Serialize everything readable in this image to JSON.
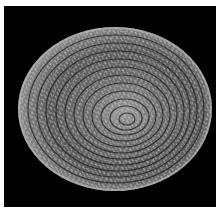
{
  "image": {
    "description": "Woven coiled basket viewed from above on a black background",
    "background_color": "#000000",
    "border_color": "#ffffff",
    "subject": "coiled woven basket",
    "colors": {
      "rim_light": "#d8d8d8",
      "mid": "#8a8a8a",
      "shadow": "#2a2a2a"
    }
  }
}
